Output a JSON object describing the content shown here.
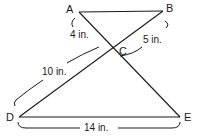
{
  "diagram": {
    "type": "geometry-similar-triangles",
    "points": {
      "A": {
        "label": "A",
        "x": 79,
        "y": 12
      },
      "B": {
        "label": "B",
        "x": 163,
        "y": 11
      },
      "C": {
        "label": "C",
        "x": 113,
        "y": 48
      },
      "D": {
        "label": "D",
        "x": 19,
        "y": 117
      },
      "E": {
        "label": "E",
        "x": 180,
        "y": 117
      }
    },
    "segments": [
      "AB",
      "AE",
      "BD",
      "DE"
    ],
    "measurements": {
      "AC": "4 in.",
      "BC": "5 in.",
      "DC": "10 in.",
      "DE": "14 in."
    },
    "colors": {
      "stroke": "#1a1a1a",
      "background": "#ffffff"
    }
  }
}
